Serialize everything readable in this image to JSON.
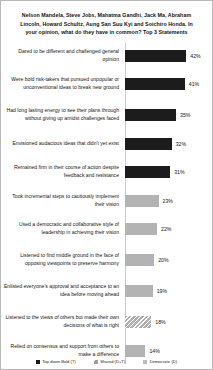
{
  "chart_data": {
    "type": "bar",
    "orientation": "horizontal",
    "title": "Nelson Mandela, Steve Jobs, Mahatma Gandhi, Jack Ma, Abraham Lincoln, Howard Schultz, Aung San Suu Kyi and Soichiro Honda. In your opinion, what do they have in common? Top 3 Statements",
    "xlabel": "",
    "ylabel": "",
    "grid": false,
    "legend_position": "bottom",
    "categories": [
      "Dared to be different and challenged general opinion",
      "Were bold risk-takers that pursued unpopular or unconventional ideas to break new ground",
      "Had long lasting energy to see their plans through without giving up amidst challenges faced",
      "Envisioned audacious  ideas that didn't yet exist",
      "Remained firm in their course of action despite feedback and resistance",
      "Took incremental steps to cautiously implement their vision",
      "Used a democratic and collaborative style of leadership  in achieving their vision",
      "Listened to find middle ground in the face of opposing viewpoints  to preserve harmony",
      "Enlisted everyone's approval and acceptance to an idea before moving ahead",
      "Listened to the views of others but made their own decisions of what is right",
      "Relied on consensus and support from others to make a difference"
    ],
    "values": [
      42,
      41,
      35,
      32,
      31,
      23,
      22,
      20,
      19,
      18,
      14
    ],
    "value_labels": [
      "42%",
      "41%",
      "35%",
      "32%",
      "31%",
      "23%",
      "22%",
      "20%",
      "19%",
      "18%",
      "14%"
    ],
    "point_styles": [
      "solid",
      "solid",
      "solid",
      "solid",
      "solid",
      "gray",
      "gray",
      "gray",
      "gray",
      "hatch",
      "gray"
    ],
    "xlim": [
      0,
      48
    ],
    "legend": [
      {
        "label": "Top-down Bold (T)",
        "style": "solid",
        "color": "#1c1c1c"
      },
      {
        "label": "Shared (D+T)",
        "style": "hatch",
        "color": "#bdbdbd"
      },
      {
        "label": "Democratic (D)",
        "style": "gray",
        "color": "#bdbdbd"
      }
    ]
  }
}
